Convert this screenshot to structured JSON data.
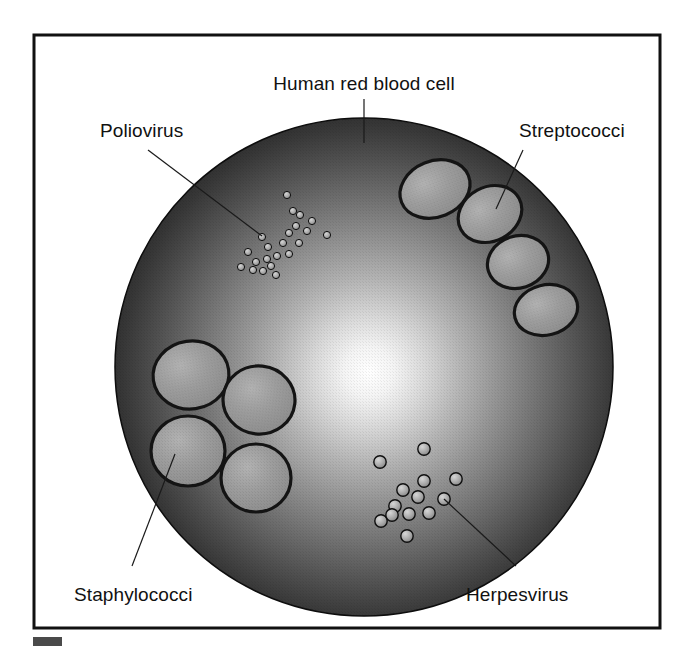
{
  "figure": {
    "frame": {
      "x": 34,
      "y": 35,
      "width": 626,
      "height": 593
    },
    "background_color": "#ffffff",
    "frame_color": "#111111"
  },
  "cell": {
    "name": "human-red-blood-cell",
    "center_x": 364,
    "center_y": 367,
    "radius": 249,
    "highlight_x": 368,
    "highlight_y": 372,
    "highlight_color": "#ffffff",
    "mid_color": "#7a7a7a",
    "edge_color": "#1b1b1b",
    "outline_color": "#0d0d0d"
  },
  "organism_fill": "#9a9a9a",
  "organism_outline": "#141414",
  "labels": [
    {
      "id": "human-red-blood-cell",
      "text": "Human red blood cell",
      "text_x": 364,
      "text_y": 90,
      "anchor": "middle",
      "leader": "M364,99 L364,143"
    },
    {
      "id": "poliovirus",
      "text": "Poliovirus",
      "text_x": 100,
      "text_y": 137,
      "anchor": "start",
      "leader": "M148,150 L262,236"
    },
    {
      "id": "streptococci",
      "text": "Streptococci",
      "text_x": 519,
      "text_y": 137,
      "anchor": "start",
      "leader": "M523,150 L496,209"
    },
    {
      "id": "staphylococci",
      "text": "Staphylococci",
      "text_x": 74,
      "text_y": 601,
      "anchor": "start",
      "leader": "M175,454 L132,566"
    },
    {
      "id": "herpesvirus",
      "text": "Herpesvirus",
      "text_x": 466,
      "text_y": 601,
      "anchor": "start",
      "leader": "M444,499 L516,566"
    }
  ],
  "streptococci": {
    "label": "Streptococci",
    "count": 4,
    "cells": [
      {
        "cx": 435,
        "cy": 189,
        "rx": 36,
        "ry": 28,
        "rotate": -22
      },
      {
        "cx": 490,
        "cy": 214,
        "rx": 33,
        "ry": 27,
        "rotate": -28
      },
      {
        "cx": 518,
        "cy": 262,
        "rx": 31,
        "ry": 26,
        "rotate": -18
      },
      {
        "cx": 546,
        "cy": 310,
        "rx": 32,
        "ry": 25,
        "rotate": -14
      }
    ]
  },
  "staphylococci": {
    "label": "Staphylococci",
    "count": 4,
    "cells": [
      {
        "cx": 191,
        "cy": 375,
        "rx": 38,
        "ry": 34,
        "rotate": -8
      },
      {
        "cx": 259,
        "cy": 400,
        "rx": 36,
        "ry": 34,
        "rotate": 6
      },
      {
        "cx": 188,
        "cy": 451,
        "rx": 37,
        "ry": 35,
        "rotate": 0
      },
      {
        "cx": 256,
        "cy": 478,
        "rx": 35,
        "ry": 34,
        "rotate": 0
      }
    ]
  },
  "poliovirus": {
    "label": "Poliovirus",
    "count": 22,
    "radius": 3.6,
    "particles": [
      {
        "cx": 262,
        "cy": 237
      },
      {
        "cx": 267,
        "cy": 259
      },
      {
        "cx": 248,
        "cy": 252
      },
      {
        "cx": 256,
        "cy": 262
      },
      {
        "cx": 253,
        "cy": 270
      },
      {
        "cx": 241,
        "cy": 267
      },
      {
        "cx": 263,
        "cy": 271
      },
      {
        "cx": 271,
        "cy": 266
      },
      {
        "cx": 277,
        "cy": 256
      },
      {
        "cx": 268,
        "cy": 247
      },
      {
        "cx": 283,
        "cy": 243
      },
      {
        "cx": 289,
        "cy": 233
      },
      {
        "cx": 296,
        "cy": 226
      },
      {
        "cx": 293,
        "cy": 211
      },
      {
        "cx": 300,
        "cy": 215
      },
      {
        "cx": 307,
        "cy": 231
      },
      {
        "cx": 299,
        "cy": 243
      },
      {
        "cx": 289,
        "cy": 254
      },
      {
        "cx": 276,
        "cy": 275
      },
      {
        "cx": 287,
        "cy": 195
      },
      {
        "cx": 312,
        "cy": 221
      },
      {
        "cx": 327,
        "cy": 235
      }
    ]
  },
  "herpesvirus": {
    "label": "Herpesvirus",
    "count": 13,
    "radius": 6.2,
    "particles": [
      {
        "cx": 424,
        "cy": 449
      },
      {
        "cx": 380,
        "cy": 462
      },
      {
        "cx": 424,
        "cy": 481
      },
      {
        "cx": 456,
        "cy": 479
      },
      {
        "cx": 403,
        "cy": 490
      },
      {
        "cx": 418,
        "cy": 497
      },
      {
        "cx": 444,
        "cy": 499
      },
      {
        "cx": 395,
        "cy": 506
      },
      {
        "cx": 409,
        "cy": 514
      },
      {
        "cx": 429,
        "cy": 513
      },
      {
        "cx": 381,
        "cy": 521
      },
      {
        "cx": 407,
        "cy": 536
      },
      {
        "cx": 392,
        "cy": 515
      }
    ]
  },
  "scale_marker": {
    "name": "scale-bar-marker",
    "x": 33,
    "y": 637,
    "width": 29,
    "height": 9,
    "color": "#4a4a4a"
  }
}
